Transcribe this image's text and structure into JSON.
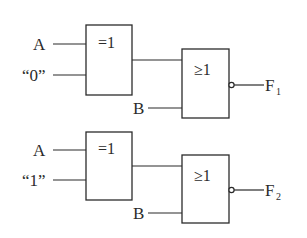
{
  "diagram": {
    "type": "logic-circuit",
    "circuits": [
      {
        "id": "circuit-1",
        "xor_gate": {
          "symbol": "=1",
          "inputs": [
            "A",
            "“0”"
          ]
        },
        "nor_gate": {
          "symbol": "≥1",
          "inputs": [
            "XOR output",
            "B"
          ],
          "inverted_output": true
        },
        "output": {
          "name": "F",
          "subscript": "1"
        }
      },
      {
        "id": "circuit-2",
        "xor_gate": {
          "symbol": "=1",
          "inputs": [
            "A",
            "“1”"
          ]
        },
        "nor_gate": {
          "symbol": "≥1",
          "inputs": [
            "XOR output",
            "B"
          ],
          "inverted_output": true
        },
        "output": {
          "name": "F",
          "subscript": "2"
        }
      }
    ]
  },
  "labels": {
    "c1_in_a": "A",
    "c1_in_const": "“0”",
    "c1_xor_symbol": "=1",
    "c1_or_symbol": "≥1",
    "c1_in_b": "B",
    "c1_out_name": "F",
    "c1_out_sub": "1",
    "c2_in_a": "A",
    "c2_in_const": "“1”",
    "c2_xor_symbol": "=1",
    "c2_or_symbol": "≥1",
    "c2_in_b": "B",
    "c2_out_name": "F",
    "c2_out_sub": "2"
  },
  "colors": {
    "line": "#2b2b2b",
    "background": "#ffffff"
  }
}
